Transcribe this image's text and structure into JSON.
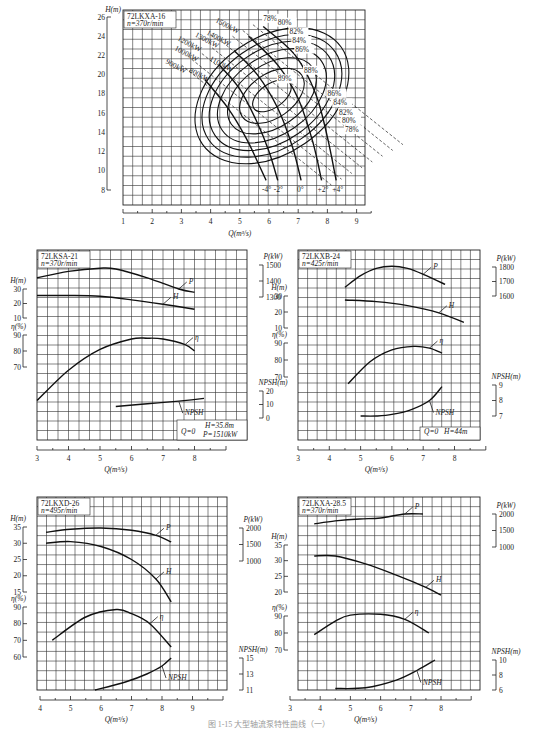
{
  "caption": "图 1-15  大型轴流泵特性曲线（一）",
  "chart_data": [
    {
      "id": "72LKXA-16",
      "type": "line",
      "title": "72LKXA-16",
      "subtitle": "n=370r/min",
      "xlabel": "Q(m³/s)",
      "ylabel": "H(m)",
      "xlim": [
        1,
        9.5
      ],
      "ylim": [
        7,
        26.5
      ],
      "xticks": [
        1,
        2,
        3,
        4,
        5,
        6,
        7,
        8,
        9
      ],
      "yticks": [
        8,
        10,
        12,
        14,
        16,
        18,
        20,
        22,
        24,
        26
      ],
      "grid": true,
      "blade_angle_curves": [
        {
          "name": "-4°",
          "points": [
            [
              3.8,
              19.5
            ],
            [
              4.6,
              16.5
            ],
            [
              5.2,
              13.5
            ],
            [
              5.6,
              11
            ],
            [
              5.9,
              9
            ]
          ]
        },
        {
          "name": "-2°",
          "points": [
            [
              4.3,
              21
            ],
            [
              5.0,
              18.5
            ],
            [
              5.6,
              15
            ],
            [
              6.0,
              12
            ],
            [
              6.3,
              9
            ]
          ]
        },
        {
          "name": "0°",
          "points": [
            [
              4.8,
              22.5
            ],
            [
              5.6,
              20
            ],
            [
              6.3,
              16.5
            ],
            [
              6.8,
              12.5
            ],
            [
              7.1,
              9
            ]
          ]
        },
        {
          "name": "+2°",
          "points": [
            [
              5.3,
              24
            ],
            [
              6.3,
              21
            ],
            [
              7.0,
              17.5
            ],
            [
              7.5,
              13
            ],
            [
              7.8,
              9
            ]
          ]
        },
        {
          "name": "+4°",
          "points": [
            [
              5.8,
              25
            ],
            [
              6.9,
              22
            ],
            [
              7.6,
              18
            ],
            [
              8.0,
              13.5
            ],
            [
              8.3,
              9
            ]
          ]
        }
      ],
      "efficiency_contours": [
        {
          "name": "78%",
          "label_at": [
            5.8,
            25.6
          ]
        },
        {
          "name": "80%",
          "label_at": [
            6.3,
            25.2
          ]
        },
        {
          "name": "82%",
          "label_at": [
            6.7,
            24.2
          ]
        },
        {
          "name": "84%",
          "label_at": [
            6.8,
            23.3
          ]
        },
        {
          "name": "86%",
          "label_at": [
            6.9,
            22.4
          ]
        },
        {
          "name": "88%",
          "label_at": [
            7.2,
            20.2
          ]
        },
        {
          "name": "89%",
          "label_at": [
            6.3,
            19.3
          ]
        },
        {
          "name": "86%",
          "label_at": [
            8.0,
            17.8
          ]
        },
        {
          "name": "84%",
          "label_at": [
            8.2,
            16.8
          ]
        },
        {
          "name": "82%",
          "label_at": [
            8.4,
            15.8
          ]
        },
        {
          "name": "80%",
          "label_at": [
            8.5,
            15.0
          ]
        },
        {
          "name": "78%",
          "label_at": [
            8.6,
            14.0
          ]
        }
      ],
      "power_lines": [
        {
          "name": "1500kW",
          "label_at": [
            4.9,
            25.5
          ]
        },
        {
          "name": "1400kW",
          "label_at": [
            4.6,
            24.2
          ]
        },
        {
          "name": "1300kW",
          "label_at": [
            4.2,
            24.0
          ]
        },
        {
          "name": "1200kW",
          "label_at": [
            3.6,
            23.6
          ]
        },
        {
          "name": "1100kW",
          "label_at": [
            4.7,
            21.5
          ]
        },
        {
          "name": "1000kW",
          "label_at": [
            3.5,
            22.6
          ]
        },
        {
          "name": "900kW",
          "label_at": [
            3.2,
            21.2
          ]
        },
        {
          "name": "800kW",
          "label_at": [
            4.0,
            20.3
          ]
        }
      ]
    },
    {
      "id": "72LKSA-21",
      "type": "line",
      "title": "72LKSA-21",
      "subtitle": "n=370r/min",
      "xlabel": "Q(m³/s)",
      "xlim": [
        3,
        9
      ],
      "xticks": [
        3,
        4,
        5,
        6,
        7,
        8
      ],
      "axes": {
        "H": {
          "label": "H(m)",
          "ticks": [
            10,
            20,
            30
          ]
        },
        "eta": {
          "label": "η(%)",
          "ticks": [
            70,
            80,
            90
          ]
        },
        "P": {
          "label": "P(kW)",
          "ticks": [
            1300,
            1400,
            1500
          ]
        },
        "NPSH": {
          "label": "NPSH(m)",
          "ticks": [
            0,
            10,
            20
          ]
        }
      },
      "series": [
        {
          "name": "P",
          "x": [
            3.0,
            4.0,
            5.0,
            5.5,
            6.5,
            7.5,
            8.0
          ],
          "y": [
            1420,
            1460,
            1480,
            1475,
            1420,
            1350,
            1330
          ]
        },
        {
          "name": "H",
          "x": [
            3.0,
            4.0,
            5.0,
            6.0,
            7.0,
            8.0
          ],
          "y": [
            25.5,
            25.5,
            25,
            22.5,
            19.5,
            16
          ]
        },
        {
          "name": "η",
          "x": [
            3.0,
            4.0,
            5.0,
            6.0,
            6.5,
            7.0,
            7.7,
            8.0
          ],
          "y": [
            49,
            68,
            81,
            87.5,
            88,
            87.5,
            84,
            80
          ]
        },
        {
          "name": "NPSH",
          "x": [
            5.5,
            6.5,
            7.5,
            8.3
          ],
          "y": [
            8.5,
            10.5,
            12.5,
            14.5
          ]
        }
      ],
      "annotation": {
        "q0": "Q=0",
        "h": "H=35.8m",
        "p": "P=1510kW"
      }
    },
    {
      "id": "72LKXB-24",
      "type": "line",
      "title": "72LKXB-24",
      "subtitle": "n=425r/min",
      "xlabel": "Q(m³/s)",
      "xlim": [
        3,
        9
      ],
      "xticks": [
        3,
        4,
        5,
        6,
        7,
        8
      ],
      "axes": {
        "H": {
          "label": "H(m)",
          "ticks": [
            10,
            20,
            30
          ]
        },
        "eta": {
          "label": "η(%)",
          "ticks": [
            70,
            80,
            90
          ]
        },
        "P": {
          "label": "P(kW)",
          "ticks": [
            1600,
            1700,
            1800
          ]
        },
        "NPSH": {
          "label": "NPSH(m)",
          "ticks": [
            7,
            8,
            9
          ]
        }
      },
      "series": [
        {
          "name": "P",
          "x": [
            4.5,
            5.0,
            5.5,
            6.0,
            6.5,
            7.0,
            7.7
          ],
          "y": [
            1660,
            1740,
            1790,
            1805,
            1790,
            1750,
            1680
          ]
        },
        {
          "name": "H",
          "x": [
            4.5,
            5.5,
            6.5,
            7.5,
            8.3
          ],
          "y": [
            27.5,
            26.5,
            24,
            19.5,
            13.5
          ]
        },
        {
          "name": "η",
          "x": [
            4.6,
            5.3,
            6.0,
            6.7,
            7.2,
            7.6
          ],
          "y": [
            66,
            79,
            86,
            88,
            87,
            84
          ]
        },
        {
          "name": "NPSH",
          "x": [
            5.0,
            5.5,
            6.0,
            6.6,
            7.2,
            7.6
          ],
          "y": [
            7.0,
            7.0,
            7.1,
            7.4,
            8.0,
            8.9
          ]
        }
      ],
      "annotation": {
        "q0": "Q=0",
        "h": "H=44m"
      }
    },
    {
      "id": "72LKXD-26",
      "type": "line",
      "title": "72LKXD-26",
      "subtitle": "n=495r/min",
      "xlabel": "Q(m³/s)",
      "xlim": [
        4,
        10
      ],
      "xticks": [
        4,
        5,
        6,
        7,
        8,
        9
      ],
      "axes": {
        "H": {
          "label": "H(m)",
          "ticks": [
            15,
            20,
            25,
            30,
            35
          ]
        },
        "eta": {
          "label": "η(%)",
          "ticks": [
            60,
            70,
            80,
            90
          ]
        },
        "P": {
          "label": "P(kW)",
          "ticks": [
            1000,
            1500,
            2000
          ]
        },
        "NPSH": {
          "label": "NPSH(m)",
          "ticks": [
            11,
            13,
            15
          ]
        }
      },
      "series": [
        {
          "name": "P",
          "x": [
            4.2,
            5.0,
            6.0,
            7.0,
            7.8,
            8.3
          ],
          "y": [
            1870,
            1960,
            2000,
            1930,
            1780,
            1580
          ]
        },
        {
          "name": "H",
          "x": [
            4.2,
            5.0,
            6.0,
            7.0,
            7.8,
            8.3
          ],
          "y": [
            30,
            30.5,
            29,
            25,
            19,
            12
          ]
        },
        {
          "name": "η",
          "x": [
            4.4,
            5.5,
            6.5,
            7.0,
            7.6,
            8.3
          ],
          "y": [
            70,
            84,
            88.5,
            86,
            80,
            66
          ]
        },
        {
          "name": "NPSH",
          "x": [
            5.8,
            6.8,
            7.5,
            8.0,
            8.3
          ],
          "y": [
            11,
            12,
            13,
            14,
            15
          ]
        }
      ]
    },
    {
      "id": "72LKXA-28.5",
      "type": "line",
      "title": "72LKXA-28.5",
      "subtitle": "n=370r/min",
      "xlabel": "Q(m³/s)",
      "xlim": [
        3,
        9
      ],
      "xticks": [
        3,
        4,
        5,
        6,
        7,
        8
      ],
      "axes": {
        "H": {
          "label": "H(m)",
          "ticks": [
            20,
            25,
            30,
            35
          ]
        },
        "eta": {
          "label": "η(%)",
          "ticks": [
            70,
            80,
            90
          ]
        },
        "P": {
          "label": "P(kW)",
          "ticks": [
            1000,
            1500,
            2000
          ]
        },
        "NPSH": {
          "label": "NPSH(m)",
          "ticks": [
            6,
            8,
            10
          ]
        }
      },
      "series": [
        {
          "name": "P",
          "x": [
            3.8,
            4.5,
            5.3,
            6.0,
            6.8,
            7.4
          ],
          "y": [
            1700,
            1790,
            1850,
            1880,
            2000,
            2000
          ]
        },
        {
          "name": "H",
          "x": [
            3.8,
            4.5,
            5.5,
            6.5,
            7.5,
            8.0
          ],
          "y": [
            31.5,
            31.5,
            29,
            25.5,
            21.5,
            19
          ]
        },
        {
          "name": "η",
          "x": [
            3.8,
            4.5,
            5.0,
            6.0,
            6.8,
            7.6
          ],
          "y": [
            79,
            87,
            90.5,
            91,
            88,
            80
          ]
        },
        {
          "name": "NPSH",
          "x": [
            4.5,
            5.5,
            6.5,
            7.2,
            7.8
          ],
          "y": [
            6.2,
            6.3,
            7.3,
            8.6,
            10
          ]
        }
      ]
    }
  ]
}
